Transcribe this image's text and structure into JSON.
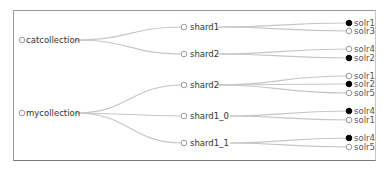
{
  "diagram": {
    "type": "tree",
    "collections": [
      {
        "name": "catcollection",
        "shards": [
          {
            "name": "shard1",
            "replicas": [
              {
                "host": "solr1",
                "leader": true
              },
              {
                "host": "solr3",
                "leader": false
              }
            ]
          },
          {
            "name": "shard2",
            "replicas": [
              {
                "host": "solr4",
                "leader": false
              },
              {
                "host": "solr2",
                "leader": true
              }
            ]
          }
        ]
      },
      {
        "name": "mycollection",
        "shards": [
          {
            "name": "shard2",
            "replicas": [
              {
                "host": "solr1",
                "leader": false
              },
              {
                "host": "solr2",
                "leader": true
              },
              {
                "host": "solr5",
                "leader": false
              }
            ]
          },
          {
            "name": "shard1_0",
            "replicas": [
              {
                "host": "solr4",
                "leader": true
              },
              {
                "host": "solr1",
                "leader": false
              }
            ]
          },
          {
            "name": "shard1_1",
            "replicas": [
              {
                "host": "solr4",
                "leader": true
              },
              {
                "host": "solr5",
                "leader": false
              }
            ]
          }
        ]
      }
    ],
    "colors": {
      "link": "#c6c6c6",
      "leader_node": "#000000",
      "replica_node": "#ffffff",
      "border": "#9a9a9a"
    }
  }
}
